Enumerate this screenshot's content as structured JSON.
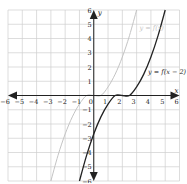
{
  "chart_data": {
    "type": "line",
    "title": "",
    "xlabel": "x",
    "ylabel": "y",
    "xlim": [
      -6,
      6
    ],
    "ylim": [
      -6,
      6
    ],
    "grid": true,
    "x_ticks": [
      -6,
      -5,
      -4,
      -3,
      -2,
      -1,
      0,
      1,
      2,
      3,
      4,
      5,
      6
    ],
    "y_ticks": [
      -6,
      -5,
      -4,
      -3,
      -2,
      -1,
      1,
      2,
      3,
      4,
      5,
      6
    ],
    "x_tick_labels": [
      "−6",
      "−5",
      "−4",
      "−3",
      "−2",
      "−1",
      "0",
      "1",
      "2",
      "3",
      "4",
      "5",
      "6"
    ],
    "y_tick_labels": [
      "−6",
      "−5",
      "−4",
      "−3",
      "−2",
      "−1",
      "1",
      "2",
      "3",
      "4",
      "5",
      "6"
    ],
    "series": [
      {
        "name": "y = f(x)",
        "color": "#c4c4c4",
        "x": [
          -3.0,
          -2.5,
          -2.0,
          -1.5,
          -1.0,
          -0.5,
          0.0,
          0.5,
          1.0,
          1.5,
          2.0,
          2.5,
          3.0
        ],
        "y": [
          -6.0,
          -4.2,
          -2.7,
          -1.5,
          -0.6,
          0.0,
          0.0,
          0.0,
          0.6,
          1.5,
          2.7,
          4.2,
          6.0
        ]
      },
      {
        "name": "y = f(x − 2)",
        "color": "#222222",
        "x": [
          -1.0,
          -0.5,
          0.0,
          0.5,
          1.0,
          1.5,
          2.0,
          2.5,
          3.0,
          3.5,
          4.0,
          4.5,
          5.0
        ],
        "y": [
          -6.0,
          -4.2,
          -2.7,
          -1.5,
          -0.6,
          0.0,
          0.0,
          0.0,
          0.6,
          1.5,
          2.7,
          4.2,
          6.0
        ]
      }
    ],
    "annotations": [
      {
        "text": "y = f(x)",
        "x": 3.2,
        "y": 4.6,
        "color": "#c4c4c4"
      },
      {
        "text": "y = f(x − 2)",
        "x": 3.8,
        "y": 1.5,
        "color": "#222222"
      }
    ]
  }
}
